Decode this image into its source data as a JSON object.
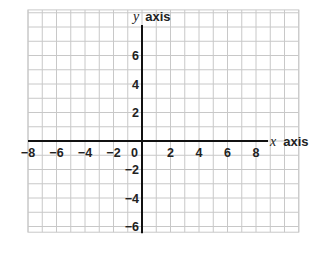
{
  "diagram": {
    "type": "coordinate-plane",
    "grid": {
      "x_min": -8,
      "x_max": 11,
      "y_min": -6.4,
      "y_max": 9.2,
      "step": 1,
      "line_color": "#c8c8c8",
      "axis_color": "#111111"
    },
    "x_axis": {
      "label_var": "x",
      "label_text": "axis",
      "ticks": [
        {
          "value": -8,
          "label": "−8"
        },
        {
          "value": -6,
          "label": "−6"
        },
        {
          "value": -4,
          "label": "−4"
        },
        {
          "value": -2,
          "label": "−2"
        },
        {
          "value": 0,
          "label": "0"
        },
        {
          "value": 2,
          "label": "2"
        },
        {
          "value": 4,
          "label": "4"
        },
        {
          "value": 6,
          "label": "6"
        },
        {
          "value": 8,
          "label": "8"
        }
      ]
    },
    "y_axis": {
      "label_var": "y",
      "label_text": "axis",
      "ticks": [
        {
          "value": 6,
          "label": "6"
        },
        {
          "value": 4,
          "label": "4"
        },
        {
          "value": 2,
          "label": "2"
        },
        {
          "value": -2,
          "label": "−2"
        },
        {
          "value": -4,
          "label": "−4"
        },
        {
          "value": -6,
          "label": "−6"
        }
      ]
    }
  }
}
